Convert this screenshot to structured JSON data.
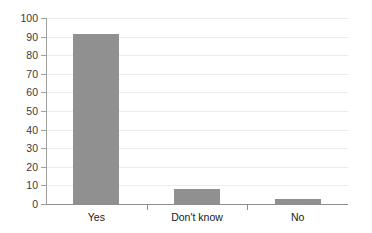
{
  "chart_data": {
    "type": "bar",
    "title": "",
    "subtitle": "",
    "xlabel": "",
    "ylabel": "",
    "categories": [
      "Yes",
      "Don't know",
      "No"
    ],
    "values": [
      91.5,
      8,
      2.5
    ],
    "ylim": [
      0,
      100
    ],
    "y_ticks": [
      0,
      10,
      20,
      30,
      40,
      50,
      60,
      70,
      80,
      90,
      100
    ],
    "y_tick_labels": [
      "0",
      "10",
      "20",
      "30",
      "40",
      "50",
      "60",
      "70",
      "80",
      "90",
      "100"
    ],
    "grid": true,
    "legend": false,
    "legend_position": "none",
    "bar_color": "#909090",
    "gridline_color": "#ebebeb",
    "axis_color": "#8c8c8c"
  }
}
